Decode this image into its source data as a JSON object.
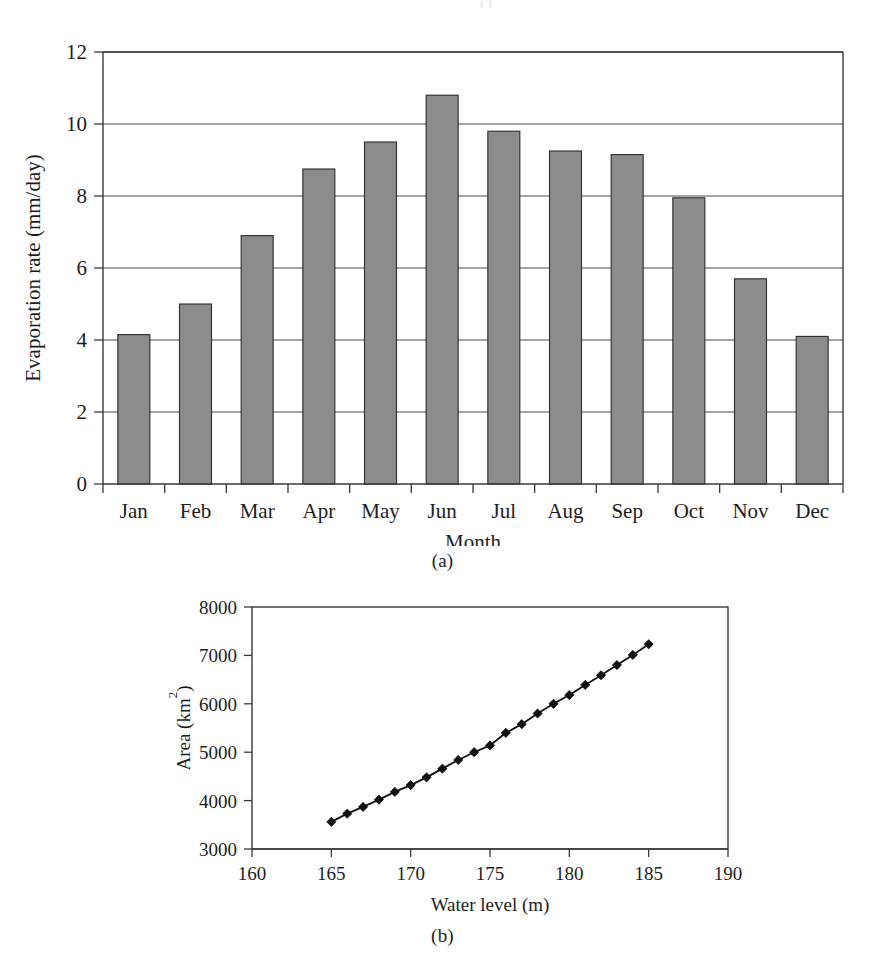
{
  "figure": {
    "panel_a_caption": "(a)",
    "panel_b_caption": "(b)",
    "top_artifact": "( )"
  },
  "chart_data": [
    {
      "id": "evaporation-bar-chart",
      "panel": "(a)",
      "type": "bar",
      "title": "",
      "xlabel": "Month",
      "ylabel": "Evaporation rate (mm/day)",
      "categories": [
        "Jan",
        "Feb",
        "Mar",
        "Apr",
        "May",
        "Jun",
        "Jul",
        "Aug",
        "Sep",
        "Oct",
        "Nov",
        "Dec"
      ],
      "values": [
        4.15,
        5.0,
        6.9,
        8.75,
        9.5,
        10.8,
        9.8,
        9.25,
        9.15,
        7.95,
        5.7,
        4.1
      ],
      "ylim": [
        0,
        12
      ],
      "yticks": [
        0,
        2,
        4,
        6,
        8,
        10,
        12
      ],
      "ytick_labels": [
        "0",
        "2",
        "4",
        "6",
        "8",
        "10",
        "12"
      ],
      "grid": "horizontal",
      "legend": "none",
      "bar_fill": "#8c8c8c",
      "bar_edge": "#2b2b2b"
    },
    {
      "id": "area-water-level-line-chart",
      "panel": "(b)",
      "type": "line",
      "title": "",
      "xlabel": "Water level (m)",
      "ylabel": "Area (km2)",
      "ylabel_display": "Area (km²)",
      "xlim": [
        160,
        190
      ],
      "ylim": [
        3000,
        8000
      ],
      "xticks": [
        160,
        165,
        170,
        175,
        180,
        185,
        190
      ],
      "xtick_labels": [
        "160",
        "165",
        "170",
        "175",
        "180",
        "185",
        "190"
      ],
      "yticks": [
        3000,
        4000,
        5000,
        6000,
        7000,
        8000
      ],
      "ytick_labels": [
        "3000",
        "4000",
        "5000",
        "6000",
        "7000",
        "8000"
      ],
      "grid": "none",
      "legend": "none",
      "marker": "diamond",
      "line_color": "#111111",
      "x": [
        165,
        166,
        167,
        168,
        169,
        170,
        171,
        172,
        173,
        174,
        175,
        176,
        177,
        178,
        179,
        180,
        181,
        182,
        183,
        184,
        185
      ],
      "values": [
        3560,
        3730,
        3870,
        4020,
        4180,
        4320,
        4480,
        4660,
        4840,
        5000,
        5140,
        5400,
        5580,
        5800,
        6000,
        6180,
        6390,
        6590,
        6800,
        7010,
        7230
      ]
    }
  ]
}
